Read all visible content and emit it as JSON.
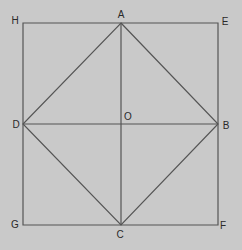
{
  "diagram": {
    "colors": {
      "background": "#c9c9c9",
      "stroke": "#555555",
      "label": "#2a2a2a"
    },
    "points": {
      "H": {
        "x": 23,
        "y": 23
      },
      "A": {
        "x": 121,
        "y": 23
      },
      "E": {
        "x": 218,
        "y": 23
      },
      "D": {
        "x": 23,
        "y": 124
      },
      "O": {
        "x": 121,
        "y": 124
      },
      "B": {
        "x": 218,
        "y": 124
      },
      "G": {
        "x": 23,
        "y": 225
      },
      "C": {
        "x": 121,
        "y": 225
      },
      "F": {
        "x": 218,
        "y": 225
      }
    },
    "labels": [
      {
        "id": "H",
        "text": "H",
        "x": 15,
        "y": 21
      },
      {
        "id": "A",
        "text": "A",
        "x": 121,
        "y": 15
      },
      {
        "id": "E",
        "text": "E",
        "x": 225,
        "y": 22
      },
      {
        "id": "D",
        "text": "D",
        "x": 16,
        "y": 125
      },
      {
        "id": "O",
        "text": "O",
        "x": 128,
        "y": 117
      },
      {
        "id": "B",
        "text": "B",
        "x": 226,
        "y": 126
      },
      {
        "id": "G",
        "text": "G",
        "x": 15,
        "y": 225
      },
      {
        "id": "C",
        "text": "C",
        "x": 120,
        "y": 235
      },
      {
        "id": "F",
        "text": "F",
        "x": 223,
        "y": 226
      }
    ],
    "segments": [
      {
        "name": "outer-square",
        "points": [
          "H",
          "E",
          "F",
          "G"
        ],
        "closed": true
      },
      {
        "name": "inscribed-square",
        "points": [
          "A",
          "B",
          "C",
          "D"
        ],
        "closed": true
      },
      {
        "name": "diagonal-DB",
        "points": [
          "D",
          "B"
        ],
        "closed": false
      },
      {
        "name": "diagonal-AC",
        "points": [
          "A",
          "C"
        ],
        "closed": false
      }
    ]
  }
}
